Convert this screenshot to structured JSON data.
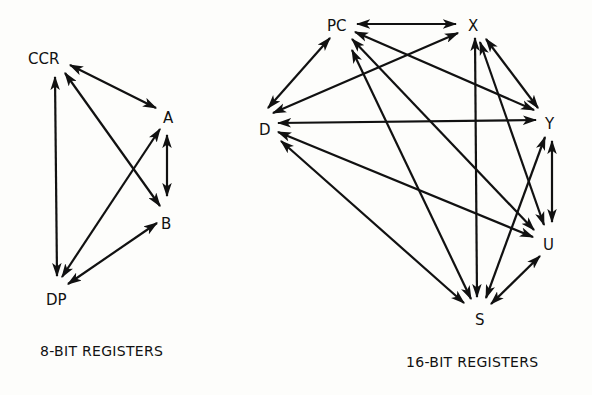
{
  "diagrams": [
    {
      "id": "8bit",
      "caption": "8-BIT REGISTERS",
      "caption_pos": [
        40,
        356
      ],
      "nodes": [
        {
          "id": "CCR",
          "label": "CCR",
          "x": 28,
          "y": 64
        },
        {
          "id": "A",
          "label": "A",
          "x": 163,
          "y": 123
        },
        {
          "id": "B",
          "label": "B",
          "x": 161,
          "y": 229
        },
        {
          "id": "DP",
          "label": "DP",
          "x": 46,
          "y": 305
        }
      ],
      "edges": [
        {
          "from": "CCR",
          "to": "A",
          "x1": 70,
          "y1": 65,
          "x2": 156,
          "y2": 108
        },
        {
          "from": "CCR",
          "to": "B",
          "x1": 65,
          "y1": 73,
          "x2": 160,
          "y2": 206
        },
        {
          "from": "CCR",
          "to": "DP",
          "x1": 55,
          "y1": 77,
          "x2": 57,
          "y2": 276
        },
        {
          "from": "A",
          "to": "B",
          "x1": 167,
          "y1": 135,
          "x2": 167,
          "y2": 196
        },
        {
          "from": "A",
          "to": "DP",
          "x1": 160,
          "y1": 129,
          "x2": 62,
          "y2": 277
        },
        {
          "from": "B",
          "to": "DP",
          "x1": 157,
          "y1": 223,
          "x2": 68,
          "y2": 284
        }
      ]
    },
    {
      "id": "16bit",
      "caption": "16-BIT REGISTERS",
      "caption_pos": [
        406,
        367
      ],
      "nodes": [
        {
          "id": "PC",
          "label": "PC",
          "x": 327,
          "y": 31
        },
        {
          "id": "X",
          "label": "X",
          "x": 468,
          "y": 31
        },
        {
          "id": "Y",
          "label": "Y",
          "x": 545,
          "y": 129
        },
        {
          "id": "U",
          "label": "U",
          "x": 543,
          "y": 250
        },
        {
          "id": "S",
          "label": "S",
          "x": 475,
          "y": 325
        },
        {
          "id": "D",
          "label": "D",
          "x": 259,
          "y": 135
        }
      ],
      "edges": [
        {
          "from": "PC",
          "to": "X",
          "x1": 357,
          "y1": 24,
          "x2": 456,
          "y2": 24
        },
        {
          "from": "PC",
          "to": "D",
          "x1": 330,
          "y1": 38,
          "x2": 268,
          "y2": 108
        },
        {
          "from": "X",
          "to": "D",
          "x1": 458,
          "y1": 33,
          "x2": 273,
          "y2": 113
        },
        {
          "from": "PC",
          "to": "Y",
          "x1": 355,
          "y1": 32,
          "x2": 534,
          "y2": 110
        },
        {
          "from": "D",
          "to": "Y",
          "x1": 278,
          "y1": 123,
          "x2": 536,
          "y2": 120
        },
        {
          "from": "PC",
          "to": "U",
          "x1": 352,
          "y1": 39,
          "x2": 534,
          "y2": 230
        },
        {
          "from": "PC",
          "to": "S",
          "x1": 352,
          "y1": 50,
          "x2": 471,
          "y2": 299
        },
        {
          "from": "X",
          "to": "S",
          "x1": 475,
          "y1": 38,
          "x2": 477,
          "y2": 297
        },
        {
          "from": "X",
          "to": "U",
          "x1": 480,
          "y1": 42,
          "x2": 544,
          "y2": 225
        },
        {
          "from": "X",
          "to": "Y",
          "x1": 486,
          "y1": 39,
          "x2": 538,
          "y2": 108
        },
        {
          "from": "D",
          "to": "U",
          "x1": 278,
          "y1": 132,
          "x2": 533,
          "y2": 237
        },
        {
          "from": "D",
          "to": "S",
          "x1": 281,
          "y1": 141,
          "x2": 464,
          "y2": 303
        },
        {
          "from": "Y",
          "to": "U",
          "x1": 552,
          "y1": 141,
          "x2": 552,
          "y2": 222
        },
        {
          "from": "Y",
          "to": "S",
          "x1": 545,
          "y1": 137,
          "x2": 486,
          "y2": 298
        },
        {
          "from": "U",
          "to": "S",
          "x1": 540,
          "y1": 256,
          "x2": 491,
          "y2": 304
        }
      ]
    }
  ],
  "style": {
    "ink": "#111111",
    "paper": "#fdfdfb",
    "arrow_type": "bidirectional"
  }
}
